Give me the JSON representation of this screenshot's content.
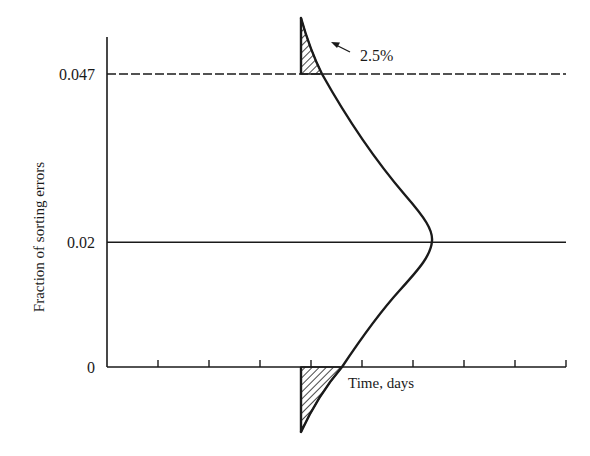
{
  "chart_data": {
    "type": "line",
    "title": "",
    "xlabel": "Time, days",
    "ylabel": "Fraction of sorting errors",
    "ylim": [
      0,
      0.05
    ],
    "y_ticks": [
      {
        "value": 0,
        "label": "0"
      },
      {
        "value": 0.02,
        "label": "0.02"
      },
      {
        "value": 0.047,
        "label": "0.047"
      }
    ],
    "x_tick_count": 9,
    "x_tick_labels": [],
    "reference_lines": [
      {
        "name": "mean",
        "value": 0.02,
        "style": "solid"
      },
      {
        "name": "upper-control-limit",
        "value": 0.047,
        "style": "dashed"
      }
    ],
    "distribution": {
      "kind": "normal (sideways)",
      "mean": 0.02,
      "upper_tail_area_percent": 2.5,
      "tails_shaded": [
        "above 0.047",
        "below 0"
      ]
    },
    "annotations": [
      {
        "text": "2.5%",
        "points_to": "upper shaded tail"
      }
    ],
    "grid": false,
    "legend": "none"
  }
}
